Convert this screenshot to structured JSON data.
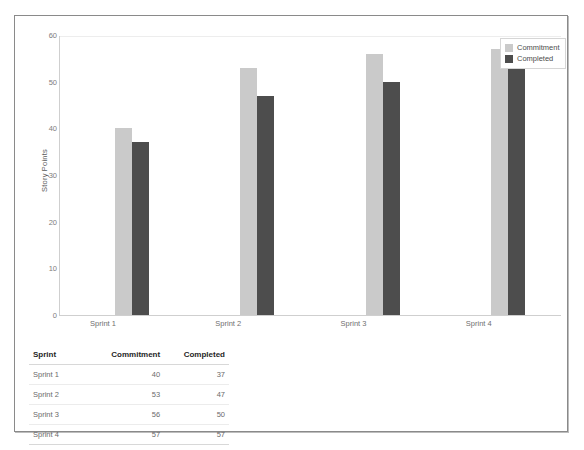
{
  "chart_data": {
    "type": "bar",
    "title": "",
    "xlabel": "",
    "ylabel": "Story Points",
    "ylim": [
      0,
      60
    ],
    "yticks": [
      60,
      50,
      40,
      30,
      20,
      10,
      0
    ],
    "grid": true,
    "legend_position": "top-right",
    "categories": [
      "Sprint 1",
      "Sprint 2",
      "Sprint 3",
      "Sprint 4"
    ],
    "series": [
      {
        "name": "Commitment",
        "color": "#cacaca",
        "values": [
          40,
          53,
          56,
          57
        ]
      },
      {
        "name": "Completed",
        "color": "#4d4d4d",
        "values": [
          37,
          47,
          50,
          57
        ]
      }
    ]
  },
  "legend": {
    "items": [
      {
        "label": "Commitment",
        "swatch": "commitment"
      },
      {
        "label": "Completed",
        "swatch": "completed"
      }
    ]
  },
  "table": {
    "headers": [
      "Sprint",
      "Commitment",
      "Completed"
    ],
    "rows": [
      [
        "Sprint 1",
        "40",
        "37"
      ],
      [
        "Sprint 2",
        "53",
        "47"
      ],
      [
        "Sprint 3",
        "56",
        "50"
      ],
      [
        "Sprint 4",
        "57",
        "57"
      ]
    ]
  }
}
